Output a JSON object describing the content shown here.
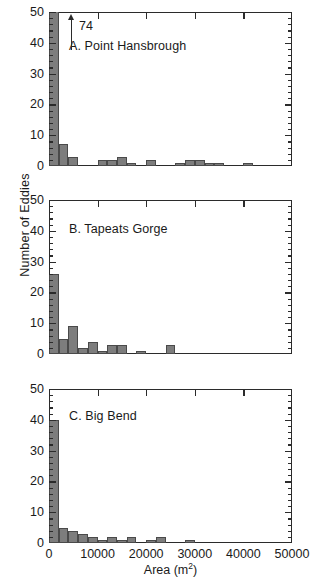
{
  "chart_data": {
    "type": "bar",
    "title": "",
    "xlabel": "Area (m2)",
    "xlabel_base": "Area (m",
    "xlabel_sup": "2",
    "xlabel_tail": ")",
    "ylabel": "Number of Eddies",
    "xlim": [
      0,
      50000
    ],
    "ylim": [
      0,
      50
    ],
    "bin_width": 2000,
    "grid": false,
    "legend": null,
    "y_ticks": [
      0,
      10,
      20,
      30,
      40,
      50
    ],
    "y_tick_labels": [
      "0",
      "10",
      "20",
      "30",
      "40",
      "50"
    ],
    "y_minor_step": 2,
    "x_ticks": [
      0,
      10000,
      20000,
      30000,
      40000,
      50000
    ],
    "x_tick_labels": [
      "0",
      "10000",
      "20000",
      "30000",
      "40000",
      "50000"
    ],
    "x_minor_step": 2000,
    "bar_color": "#7d7d7d",
    "bar_edge_color": "#4a4a4a",
    "axis_color": "#2b2b2b",
    "panels": [
      {
        "id": "A",
        "label": "A. Point Hansbrough",
        "bin_edges": [
          0,
          2000,
          4000,
          6000,
          8000,
          10000,
          12000,
          14000,
          16000,
          18000,
          20000,
          22000,
          24000,
          26000,
          28000,
          30000,
          32000,
          34000,
          36000,
          38000,
          40000,
          42000,
          44000,
          46000,
          48000,
          50000
        ],
        "values": [
          74,
          7,
          3,
          0,
          0,
          2,
          2,
          3,
          1,
          0,
          2,
          0,
          0,
          1,
          2,
          2,
          1,
          1,
          0,
          0,
          1,
          0,
          0,
          0,
          0
        ],
        "overflow": {
          "bin_index": 0,
          "value": 74,
          "label": "74",
          "marker": "up-arrow"
        }
      },
      {
        "id": "B",
        "label": "B. Tapeats Gorge",
        "bin_edges": [
          0,
          2000,
          4000,
          6000,
          8000,
          10000,
          12000,
          14000,
          16000,
          18000,
          20000,
          22000,
          24000,
          26000,
          28000,
          30000,
          32000,
          34000,
          36000,
          38000,
          40000,
          42000,
          44000,
          46000,
          48000,
          50000
        ],
        "values": [
          26,
          5,
          9,
          2,
          4,
          1,
          3,
          3,
          0,
          1,
          0,
          0,
          3,
          0,
          0,
          0,
          0,
          0,
          0,
          0,
          0,
          0,
          0,
          0,
          0
        ],
        "overflow": null
      },
      {
        "id": "C",
        "label": "C. Big Bend",
        "bin_edges": [
          0,
          2000,
          4000,
          6000,
          8000,
          10000,
          12000,
          14000,
          16000,
          18000,
          20000,
          22000,
          24000,
          26000,
          28000,
          30000,
          32000,
          34000,
          36000,
          38000,
          40000,
          42000,
          44000,
          46000,
          48000,
          50000
        ],
        "values": [
          40,
          5,
          4,
          3,
          2,
          1,
          2,
          1,
          2,
          0,
          1,
          2,
          0,
          0,
          1,
          0,
          0,
          0,
          0,
          0,
          0,
          0,
          0,
          0,
          0
        ],
        "overflow": null
      }
    ]
  }
}
